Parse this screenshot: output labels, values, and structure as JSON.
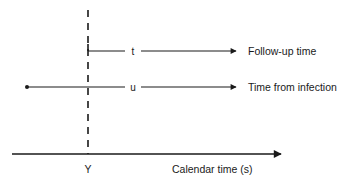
{
  "diagram": {
    "type": "timeline",
    "colors": {
      "ink": "#1a1a1a",
      "background": "#ffffff"
    },
    "reference_line": {
      "label": "Y",
      "style": "dashed-vertical"
    },
    "lines": [
      {
        "id": "follow-up",
        "marker": "t",
        "label": "Follow-up time",
        "starts_at": "Y"
      },
      {
        "id": "infection",
        "marker": "u",
        "label": "Time from infection",
        "starts_at": "infection point"
      }
    ],
    "axis": {
      "label": "Calendar time (s)",
      "tick_label": "Y"
    }
  }
}
